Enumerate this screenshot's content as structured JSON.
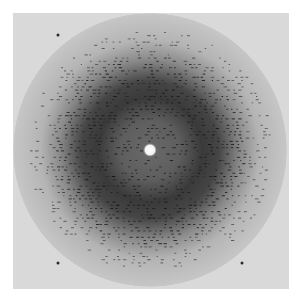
{
  "image": {
    "description": "X-ray diffraction pattern",
    "background_color": "#ffffff",
    "detector_color": "#d9d9d9",
    "detector_box": {
      "x": 13,
      "y": 13,
      "size": 276
    },
    "center": {
      "x": 137,
      "y": 137
    },
    "outer_circle": {
      "radius": 137,
      "color": "#c4c4c4"
    },
    "dark_ring": {
      "inner_radius": 40,
      "peak_radius": 62,
      "outer_radius": 110,
      "color": "#3a3a3a"
    },
    "inner_disc": {
      "radius": 40,
      "color": "#6e6e6e"
    },
    "beam_spot": {
      "radius": 5,
      "color": "#ffffff"
    },
    "isolated_spots": [
      {
        "x": 45,
        "y": 22
      },
      {
        "x": 45,
        "y": 250
      },
      {
        "x": 229,
        "y": 250
      }
    ]
  }
}
